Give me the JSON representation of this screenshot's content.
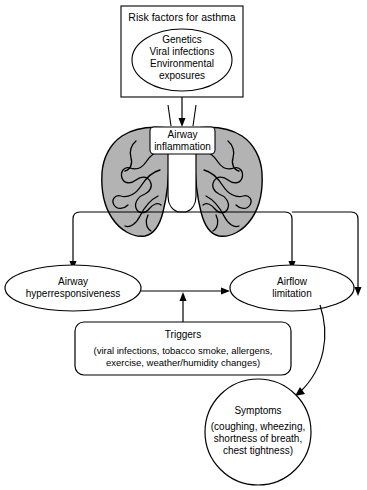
{
  "diagram": {
    "title_node": {
      "label": "Risk factors for asthma",
      "bubble_lines": [
        "Genetics",
        "Viral infections",
        "Environmental",
        "exposures"
      ]
    },
    "inflammation_node": {
      "line1": "Airway",
      "line2": "inflammation"
    },
    "lungs": {
      "name": "lungs-illustration",
      "fill": "#b3b3b3",
      "stroke": "#000000"
    },
    "hyperresponsiveness_node": {
      "line1": "Airway",
      "line2": "hyperresponsiveness"
    },
    "airflow_node": {
      "line1": "Airflow",
      "line2": "limitation"
    },
    "triggers_node": {
      "title": "Triggers",
      "line1": "(viral infections, tobacco smoke, allergens,",
      "line2": "exercise, weather/humidity changes)"
    },
    "symptoms_node": {
      "title": "Symptoms",
      "line1": "(coughing, wheezing,",
      "line2": "shortness of breath,",
      "line3": "chest tightness)"
    },
    "colors": {
      "background": "#ffffff",
      "stroke": "#000000",
      "lung_fill": "#b3b3b3",
      "box_fill": "#ffffff"
    }
  }
}
